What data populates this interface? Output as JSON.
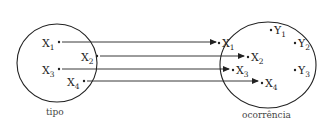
{
  "diagram": {
    "type": "set-mapping",
    "colors": {
      "stroke": "#222222",
      "text": "#222222",
      "background": "#ffffff"
    },
    "sets": [
      {
        "id": "tipo",
        "caption": "tipo"
      },
      {
        "id": "ocorrencia",
        "caption": "ocorrência"
      }
    ],
    "left_elements": [
      {
        "base": "X",
        "sub": "1"
      },
      {
        "base": "X",
        "sub": "2"
      },
      {
        "base": "X",
        "sub": "3"
      },
      {
        "base": "X",
        "sub": "4"
      }
    ],
    "right_elements": [
      {
        "base": "X",
        "sub": "1"
      },
      {
        "base": "X",
        "sub": "2"
      },
      {
        "base": "X",
        "sub": "3"
      },
      {
        "base": "X",
        "sub": "4"
      },
      {
        "base": "Y",
        "sub": "1"
      },
      {
        "base": "Y",
        "sub": "2"
      },
      {
        "base": "Y",
        "sub": "3"
      }
    ],
    "mappings": [
      {
        "from": "X1",
        "to": "X1"
      },
      {
        "from": "X2",
        "to": "X2"
      },
      {
        "from": "X3",
        "to": "X3"
      },
      {
        "from": "X4",
        "to": "X4"
      }
    ]
  }
}
